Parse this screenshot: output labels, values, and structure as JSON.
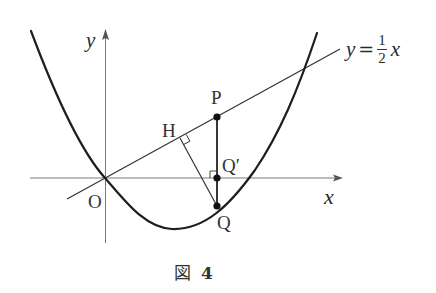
{
  "figure": {
    "caption_kanji": "図",
    "caption_number": "4"
  },
  "axes": {
    "x_label": "x",
    "y_label": "y",
    "origin_label": "O"
  },
  "line": {
    "label_y": "y",
    "label_eq": "=",
    "label_num": "1",
    "label_den": "2",
    "label_x": "x",
    "slope": 0.5
  },
  "points": {
    "P": "P",
    "H": "H",
    "Q_prime": "Q′",
    "Q": "Q"
  },
  "geometry": {
    "origin_px": [
      105,
      178
    ],
    "x_axis_px": [
      30,
      343
    ],
    "y_axis_px": [
      243,
      30
    ],
    "line_px": [
      [
        67,
        199
      ],
      [
        340,
        49
      ]
    ],
    "P_px": [
      217,
      117
    ],
    "Q_prime_px": [
      217,
      178
    ],
    "Q_px": [
      217,
      206
    ],
    "H_px": [
      180,
      138
    ],
    "parabola_vertex_px": [
      172,
      229
    ]
  },
  "colors": {
    "curve": "#1e1e1e",
    "thin": "#3a3a3a",
    "axis": "#777777",
    "text": "#2a2a2a"
  }
}
